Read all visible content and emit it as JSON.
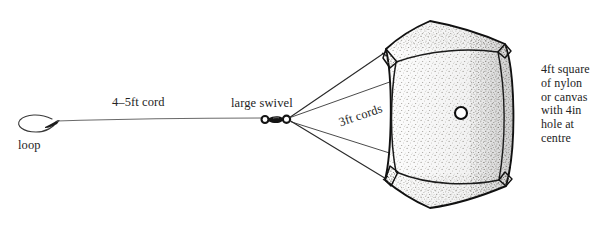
{
  "figure": {
    "background_color": "#ffffff",
    "ink_color": "#1a1a1a",
    "cord_color": "#5a5a5a",
    "stipple_color": "#6e6a62"
  },
  "labels": {
    "loop": "loop",
    "cord": "4–5ft cord",
    "swivel": "large swivel",
    "shrouds": "3ft cords",
    "canopy": "4ft square\nof nylon\nor canvas\nwith 4in\nhole at\ncentre"
  },
  "parts": [
    {
      "name": "loop",
      "label": "loop"
    },
    {
      "name": "main-cord",
      "label": "4–5ft cord"
    },
    {
      "name": "swivel",
      "label": "large swivel"
    },
    {
      "name": "shroud-cords",
      "label": "3ft cords",
      "count": 4
    },
    {
      "name": "canopy",
      "label": "4ft square of nylon or canvas with 4in hole at centre"
    },
    {
      "name": "centre-hole",
      "label": "4in hole at centre"
    }
  ],
  "geometry": {
    "loop_center_x": 30,
    "loop_center_y": 124,
    "swivel_x": 288,
    "swivel_y": 119,
    "centre_hole_x": 461,
    "centre_hole_y": 113,
    "centre_hole_radius": 6
  }
}
